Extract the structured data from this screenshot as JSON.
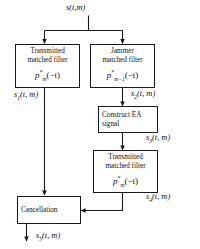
{
  "diagram": {
    "background_color": "#ffffff",
    "line_color": "#1a1a1a",
    "text_color": "#111111",
    "input_signal": {
      "name": "s",
      "subscript": "",
      "args": "(t, m)",
      "full": "s(t,m)"
    },
    "boxes": [
      {
        "id": "transmitted-matched-filter-1",
        "line1": "Transmitted",
        "line2": "matched filter",
        "formula_base": "p",
        "formula_sup": "*",
        "formula_sub": "m",
        "formula_arg": "(−t)",
        "align": "center"
      },
      {
        "id": "jammer-matched-filter",
        "line1": "Jammer",
        "line2": "matched filter",
        "formula_base": "p",
        "formula_sup": "*",
        "formula_sub": "m−1",
        "formula_arg": "(−t)",
        "align": "center"
      },
      {
        "id": "construct-ea-signal",
        "line1": "Construct EA",
        "line2": "signal",
        "formula_base": "",
        "formula_sup": "",
        "formula_sub": "",
        "formula_arg": "",
        "align": "left"
      },
      {
        "id": "transmitted-matched-filter-2",
        "line1": "Transmitted",
        "line2": "matched filter",
        "formula_base": "p",
        "formula_sup": "*",
        "formula_sub": "m",
        "formula_arg": "(−t)",
        "align": "center"
      },
      {
        "id": "cancellation",
        "line1": "Cancellation",
        "line2": "",
        "formula_base": "",
        "formula_sup": "",
        "formula_sub": "",
        "formula_arg": "",
        "align": "left"
      }
    ],
    "signal_labels": [
      {
        "id": "s1",
        "base": "s",
        "sub": "1",
        "args": "(t, m)"
      },
      {
        "id": "s2",
        "base": "s",
        "sub": "2",
        "args": "(t, m)"
      },
      {
        "id": "s3",
        "base": "s",
        "sub": "3",
        "args": "(t, m)"
      },
      {
        "id": "s4",
        "base": "s",
        "sub": "4",
        "args": "(t, m)"
      },
      {
        "id": "s5",
        "base": "s",
        "sub": "5",
        "args": "(t, m)"
      }
    ]
  }
}
